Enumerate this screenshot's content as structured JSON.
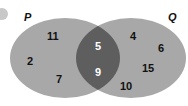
{
  "diagram": {
    "type": "venn",
    "sets": [
      {
        "name": "P",
        "label": "P",
        "only": [
          "11",
          "2",
          "7"
        ]
      },
      {
        "name": "Q",
        "label": "Q",
        "only": [
          "4",
          "6",
          "15",
          "10"
        ]
      }
    ],
    "intersection": [
      "5",
      "9"
    ],
    "colors": {
      "set_fill": "#a8a8a8",
      "intersection_fill": "#5e5e5e",
      "text": "#111111",
      "intersection_text": "#ffffff"
    }
  }
}
